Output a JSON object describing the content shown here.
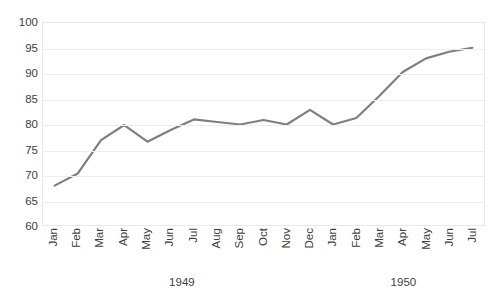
{
  "chart_data": {
    "type": "line",
    "title": "",
    "subtitle": "",
    "xlabel": "",
    "ylabel": "",
    "ylim": [
      60,
      100
    ],
    "yticks": [
      60,
      65,
      70,
      75,
      80,
      85,
      90,
      95,
      100
    ],
    "ytick_labels": [
      "60",
      "65",
      "70",
      "75",
      "80",
      "85",
      "90",
      "95",
      "100"
    ],
    "grid": true,
    "legend": "none",
    "line_color": "#7f7f7f",
    "line_width": 2.2,
    "categories": [
      "Jan",
      "Feb",
      "Mar",
      "Apr",
      "May",
      "Jun",
      "Jul",
      "Aug",
      "Sep",
      "Oct",
      "Nov",
      "Dec",
      "Jan",
      "Feb",
      "Mar",
      "Apr",
      "May",
      "Jun",
      "Jul"
    ],
    "group_labels": [
      "1949",
      "1950"
    ],
    "groups": [
      {
        "label": "1949",
        "start_index": 0,
        "end_index": 11
      },
      {
        "label": "1950",
        "start_index": 12,
        "end_index": 18
      }
    ],
    "values": [
      67.8,
      70.2,
      76.8,
      79.8,
      76.5,
      78.8,
      80.9,
      80.4,
      79.9,
      80.8,
      79.9,
      82.8,
      79.9,
      81.2,
      85.6,
      90.3,
      93.0,
      94.3,
      95.1
    ],
    "series": [
      {
        "name": "series-1",
        "values": [
          67.8,
          70.2,
          76.8,
          79.8,
          76.5,
          78.8,
          80.9,
          80.4,
          79.9,
          80.8,
          79.9,
          82.8,
          79.9,
          81.2,
          85.6,
          90.3,
          93.0,
          94.3,
          95.1
        ]
      }
    ]
  }
}
